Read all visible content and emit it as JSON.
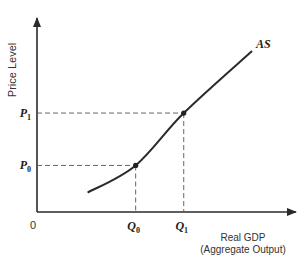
{
  "chart_data": {
    "type": "line",
    "title": "",
    "xlabel": "Real GDP\n(Aggregate Output)",
    "xlabel_lines": [
      "Real GDP",
      "(Aggregate Output)"
    ],
    "ylabel": "Price Level",
    "origin_label": "0",
    "series": [
      {
        "name": "AS",
        "label": "AS",
        "description": "Upward-sloping aggregate supply curve that becomes steeper as output rises",
        "x": [
          0.2,
          0.39,
          0.58,
          0.85
        ],
        "y": [
          0.1,
          0.24,
          0.51,
          0.83
        ]
      }
    ],
    "annotations": {
      "points": [
        {
          "name": "point-0",
          "x_label": "Q0",
          "y_label": "P0",
          "x": 0.39,
          "y": 0.24
        },
        {
          "name": "point-1",
          "x_label": "Q1",
          "y_label": "P1",
          "x": 0.58,
          "y": 0.51
        }
      ],
      "x_ticks": [
        {
          "base": "Q",
          "sub": "0"
        },
        {
          "base": "Q",
          "sub": "1"
        }
      ],
      "y_ticks": [
        {
          "base": "P",
          "sub": "0"
        },
        {
          "base": "P",
          "sub": "1"
        }
      ]
    },
    "xlim": [
      0,
      1
    ],
    "ylim": [
      0,
      1
    ],
    "grid": false,
    "legend": "none"
  }
}
